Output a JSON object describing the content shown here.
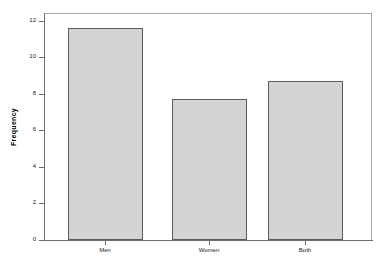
{
  "chart_data": {
    "type": "bar",
    "title": "",
    "subtitle": "",
    "xlabel": "",
    "ylabel": "Frequency",
    "categories": [
      "Men",
      "Women",
      "Both"
    ],
    "values": [
      12,
      8,
      9
    ],
    "ylim": [
      0,
      12.8
    ],
    "yticks": [
      0,
      2,
      4,
      6,
      8,
      10,
      12
    ],
    "ytick_labels": [
      "0",
      "2",
      "4",
      "6",
      "8",
      "10",
      "12"
    ],
    "grid": false,
    "legend": null,
    "series": [
      {
        "name": "Frequency",
        "values": [
          12,
          8,
          9
        ]
      }
    ],
    "bar_fill_color": "#d4d4d4",
    "bar_border_color": "#5d5d5d",
    "axis_color": "#6e6e6e",
    "frame_color": "#a8a8a8",
    "background_color": "#ffffff"
  }
}
